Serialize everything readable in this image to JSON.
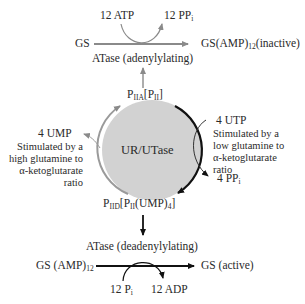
{
  "top_reaction": {
    "input_cofactor": "12 ATP",
    "output_cofactor_main": "12 PP",
    "output_cofactor_sub": "i",
    "substrate": "GS",
    "product_main": "GS(AMP)",
    "product_sub": "12",
    "product_state": "(inactive)",
    "enzyme": "ATase (adenylylating)"
  },
  "cycle": {
    "center_label": "UR/UTase",
    "top_node": {
      "p": "P",
      "sub1": "IIA",
      "mid": "[P",
      "sub2": "II",
      "end": "]"
    },
    "bottom_node": {
      "p": "P",
      "sub1": "IID",
      "mid": "[P",
      "sub2": "II",
      "mid2": "(UMP)",
      "sub3": "4",
      "end": "]"
    },
    "right": {
      "input": "4 UTP",
      "output_main": "4 PP",
      "output_sub": "i",
      "note_lines": [
        "Stimulated by a",
        "low glutamine to",
        "α-ketoglutarate",
        "ratio"
      ]
    },
    "left": {
      "output": "4 UMP",
      "note_lines": [
        "Stimulated by a",
        "high glutamine to",
        "α-ketoglutarate",
        "ratio"
      ]
    },
    "colors": {
      "circle_fill": "#d2d2d2",
      "gray_arc": "#9a9a9a",
      "black_arc": "#111111"
    }
  },
  "bottom_reaction": {
    "enzyme": "ATase (deadenylylating)",
    "substrate_main": "GS (AMP)",
    "substrate_sub": "12",
    "product": "GS (active)",
    "input_cofactor_main": "12 P",
    "input_cofactor_sub": "i",
    "output_cofactor": "12 ADP"
  }
}
